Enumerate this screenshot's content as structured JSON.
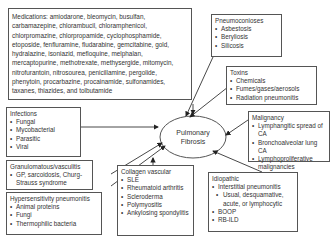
{
  "center": {
    "line1": "Pulmonary",
    "line2": "Fibrosis"
  },
  "medications": {
    "text": "Medications: amiodarone, bleomycin, busulfan, carbamazepine, chlorambucil, chloramphenicol, chlorpromazine, chlorpropamide, cyclophosphamide, etoposide, fenfluramine, fludarabine, gemcitabine, gold, hydralazine, isoniazid, mefloquine, melphalan, mercaptopurine, methotrexate, methysergide, mitomycin, nitrofurantoin, nitrosourea, penicillamine, pergolide, phenytoin, procarbazine, procainamide, sulfonamides, taxanes, thiazides, and tolbutamide"
  },
  "pneumoconioses": {
    "title": "Pneumoconioses",
    "items": [
      "Asbestosis",
      "Beryliosis",
      "Silicosis"
    ]
  },
  "toxins": {
    "title": "Toxins",
    "items": [
      "Chemicals",
      "Fumes/gases/aerosols",
      "Radiation pneumonitis"
    ]
  },
  "malignancy": {
    "title": "Malignancy",
    "items": [
      "Lymphangitic spread of CA",
      "Bronchoalveolar lung CA",
      "Lymphoproliferative malignancies"
    ]
  },
  "infections": {
    "title": "Infections",
    "items": [
      "Fungal",
      "Mycobacterial",
      "Parasitic",
      "Viral"
    ]
  },
  "granulomatous": {
    "title": "Granulomatous/vasculitis",
    "items": [
      "GP, sarcoidosis, Churg-Strauss syndrome"
    ]
  },
  "hypersensitivity": {
    "title": "Hypersensitivity pneumonitis",
    "items": [
      "Animal proteins",
      "Fungi",
      "Thermophilic bacteria"
    ]
  },
  "collagen": {
    "title": "Collagen vascular",
    "items": [
      "SLE",
      "Rheumatoid arthritis",
      "Scleroderma",
      "Polymyositis",
      "Ankylosing spondylitis"
    ]
  },
  "idiopathic": {
    "title": "Idiopathic",
    "items": [
      "Interstitial pneumonitis",
      "Usual, desquamative, acute, or lymphocytic",
      "BOOP",
      "RB-ILD"
    ]
  }
}
